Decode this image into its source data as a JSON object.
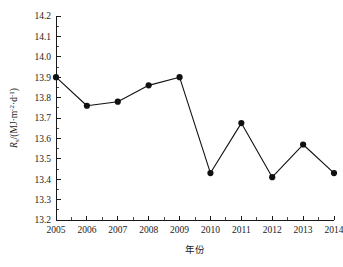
{
  "chart_data": {
    "type": "line",
    "title": "",
    "subtitle": "",
    "xlabel": "年份",
    "ylabel": "R_s/(MJ·m⁻²·d⁻¹)",
    "ylabel_parts": {
      "symbol": "R",
      "subscript": "s",
      "separator": "/(MJ·m",
      "exp1": "-2",
      "middot": "·d",
      "exp2": "-1",
      "close": ")"
    },
    "categories": [
      "2005",
      "2006",
      "2007",
      "2008",
      "2009",
      "2010",
      "2011",
      "2012",
      "2013",
      "2014"
    ],
    "x": [
      2005,
      2006,
      2007,
      2008,
      2009,
      2010,
      2011,
      2012,
      2013,
      2014
    ],
    "values": [
      13.9,
      13.76,
      13.78,
      13.86,
      13.9,
      13.43,
      13.675,
      13.41,
      13.57,
      13.43
    ],
    "series": [
      {
        "name": "Rs",
        "values": [
          13.9,
          13.76,
          13.78,
          13.86,
          13.9,
          13.43,
          13.675,
          13.41,
          13.57,
          13.43
        ]
      }
    ],
    "xlim": [
      2005,
      2014
    ],
    "ylim": [
      13.2,
      14.2
    ],
    "ytick_labels": [
      "13.2",
      "13.3",
      "13.4",
      "13.5",
      "13.6",
      "13.7",
      "13.8",
      "13.9",
      "14.0",
      "14.1",
      "14.2"
    ],
    "ytick_values": [
      13.2,
      13.3,
      13.4,
      13.5,
      13.6,
      13.7,
      13.8,
      13.9,
      14.0,
      14.1,
      14.2
    ],
    "xtick_labels": [
      "2005",
      "2006",
      "2007",
      "2008",
      "2009",
      "2010",
      "2011",
      "2012",
      "2013",
      "2014"
    ],
    "xtick_values": [
      2005,
      2006,
      2007,
      2008,
      2009,
      2010,
      2011,
      2012,
      2013,
      2014
    ],
    "grid": false,
    "legend": false,
    "legend_position": "none",
    "minor_ticks_per_interval": 2,
    "marker": "filled-circle",
    "marker_size": 3.1,
    "line_color": "#111111",
    "marker_color": "#111111",
    "axis_color": "#1a1a1a",
    "background_color": "#ffffff",
    "annotations": []
  }
}
